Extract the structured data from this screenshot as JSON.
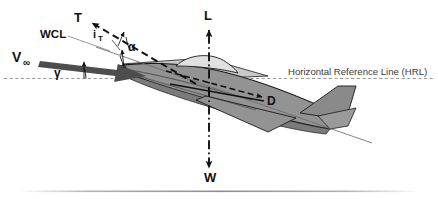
{
  "figure": {
    "kind": "aircraft-force-diagram",
    "background": "#ffffff"
  },
  "colors": {
    "body_fill": "#939393",
    "body_dark": "#7b7b7b",
    "body_light": "#c9c9c9",
    "canopy": "#e0e0e0",
    "outline": "#1a1a1a",
    "vector": "#111111",
    "velocity_arrow": "#4d4d4d",
    "hrl_line": "#9a9a9a",
    "wcl_line": "#6b6b6b",
    "text": "#111111",
    "caption_text": "#3a3a3a",
    "footer_rule": "#b4b4b4"
  },
  "vectors": [
    {
      "key": "thrust",
      "label": "T",
      "name": "thrust-vector",
      "style": "dashed",
      "direction": "up-left"
    },
    {
      "key": "lift",
      "label": "L",
      "name": "lift-vector",
      "style": "dash-dot",
      "direction": "up"
    },
    {
      "key": "weight",
      "label": "W",
      "name": "weight-vector",
      "style": "dash-dot",
      "direction": "down"
    },
    {
      "key": "drag",
      "label": "D",
      "name": "drag-vector",
      "style": "dashed",
      "direction": "right"
    },
    {
      "key": "velocity",
      "label": "V∞",
      "name": "velocity-vector",
      "style": "solid",
      "direction": "right-up"
    }
  ],
  "angles": [
    {
      "key": "gamma",
      "label": "γ",
      "name": "flight-path-angle",
      "between": "HRL and V∞"
    },
    {
      "key": "alpha",
      "label": "α",
      "name": "angle-of-attack",
      "between": "V∞ and WCL"
    },
    {
      "key": "i_t",
      "label": "i",
      "sub": "T",
      "name": "thrust-incidence-angle",
      "between": "WCL and thrust line"
    }
  ],
  "reference_lines": [
    {
      "key": "wcl",
      "label": "WCL",
      "name": "wing-chord-line",
      "style": "solid-thin"
    },
    {
      "key": "hrl",
      "label": "Horizontal Reference Line (HRL)",
      "name": "horizontal-reference-line",
      "style": "dashed"
    }
  ],
  "labels": {
    "thrust": "T",
    "lift": "L",
    "weight": "W",
    "drag": "D",
    "velocity": "V",
    "velocity_sub": "∞",
    "wcl": "WCL",
    "hrl": "Horizontal Reference Line (HRL)",
    "alpha": "α",
    "gamma": "γ",
    "it_base": "i",
    "it_sub": "T"
  }
}
